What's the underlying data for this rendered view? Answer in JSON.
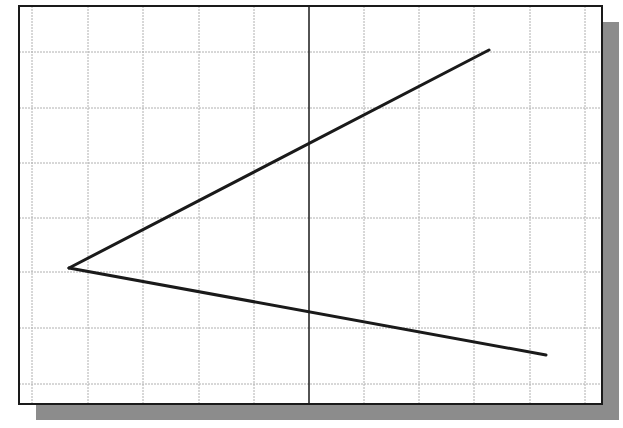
{
  "canvas": {
    "width": 623,
    "height": 428,
    "background": "#ffffff"
  },
  "frame": {
    "x": 19,
    "y": 6,
    "width": 583,
    "height": 398,
    "fill": "#ffffff",
    "border_color": "#1a1a1a",
    "border_width": 2
  },
  "shadow": {
    "dx": 17,
    "dy": 16,
    "color": "#8c8c8c"
  },
  "grid": {
    "color": "#b0b0b0",
    "width": 1,
    "vertical_x": [
      32,
      88,
      143,
      199,
      254,
      364,
      419,
      474,
      530,
      585
    ],
    "horizontal_y": [
      52,
      108,
      163,
      218,
      272,
      328,
      384
    ],
    "spacing_px": 55.3
  },
  "axis": {
    "x": 309,
    "color": "#1a1a1a",
    "width": 1.5
  },
  "lines": [
    {
      "name": "upper-line",
      "x1": 69,
      "y1": 268,
      "x2": 489,
      "y2": 50,
      "color": "#1a1a1a",
      "width": 3
    },
    {
      "name": "lower-line",
      "x1": 69,
      "y1": 268,
      "x2": 546,
      "y2": 355,
      "color": "#1a1a1a",
      "width": 3
    }
  ],
  "vertex": {
    "x": 69,
    "y": 268
  }
}
